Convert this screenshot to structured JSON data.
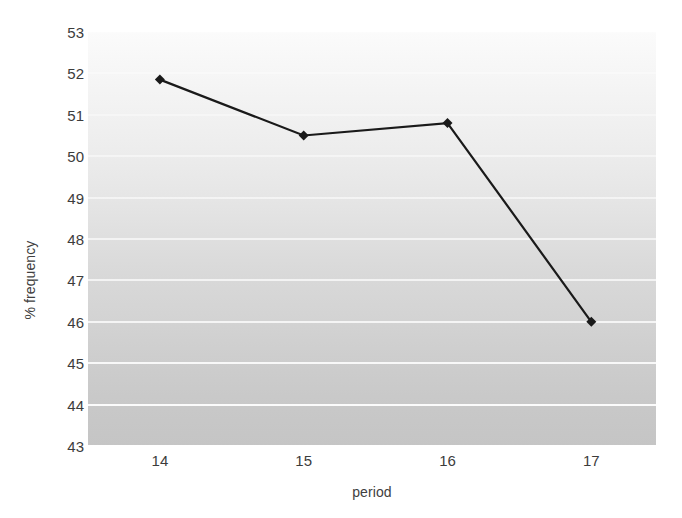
{
  "chart_data": {
    "type": "line",
    "title": "",
    "subtitle": "",
    "xlabel": "period",
    "ylabel": "% frequency",
    "x": [
      14,
      15,
      16,
      17
    ],
    "categories": [
      "14",
      "15",
      "16",
      "17"
    ],
    "values": [
      51.85,
      50.5,
      50.8,
      46.0
    ],
    "series": [
      {
        "name": "% frequency",
        "values": [
          51.85,
          50.5,
          50.8,
          46.0
        ],
        "marker": "diamond",
        "line_color": "#1a1a1a",
        "marker_color": "#1a1a1a"
      }
    ],
    "xlim": [
      13.5,
      17.45
    ],
    "ylim": [
      43,
      53
    ],
    "ytick_labels": [
      "53",
      "52",
      "51",
      "50",
      "49",
      "48",
      "47",
      "46",
      "45",
      "44",
      "43"
    ],
    "yticks": [
      53,
      52,
      51,
      50,
      49,
      48,
      47,
      46,
      45,
      44,
      43
    ],
    "xtick_labels": [
      "14",
      "15",
      "16",
      "17"
    ],
    "xticks": [
      14,
      15,
      16,
      17
    ],
    "grid": "horizontal",
    "gridline_color": "#ffffff",
    "legend": "none",
    "plot_background": "vertical-gradient-white-to-gray",
    "plot_background_top_color": "#fbfbfb",
    "plot_background_bottom_color": "#c5c5c5",
    "annotations": []
  }
}
